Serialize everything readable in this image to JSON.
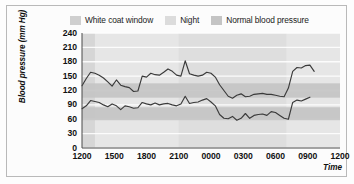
{
  "figure": {
    "border_color": "#b9b9b9",
    "background": "#fcfcfc"
  },
  "legend": {
    "position": "top-center",
    "items": [
      {
        "label": "White coat window",
        "color": "#cfcfcf",
        "name": "white-coat-window"
      },
      {
        "label": "Night",
        "color": "#d9d9d9",
        "name": "night"
      },
      {
        "label": "Normal blood pressure",
        "color": "#c2c2c2",
        "name": "normal-blood-pressure"
      }
    ]
  },
  "chart_data": {
    "type": "line",
    "title": "",
    "xlabel": "Time",
    "ylabel": "Blood pressure (mm Hg)",
    "ylim": [
      0,
      240
    ],
    "yticks": [
      0,
      30,
      60,
      90,
      120,
      150,
      180,
      210,
      240
    ],
    "ytick_labels": [
      "0",
      "30",
      "60",
      "90",
      "120",
      "150",
      "180",
      "210",
      "240"
    ],
    "xticks": [
      0,
      3,
      6,
      9,
      12,
      15,
      18,
      21,
      24
    ],
    "xtick_labels": [
      "1200",
      "1500",
      "1800",
      "2100",
      "0000",
      "0300",
      "0600",
      "0900",
      "1200"
    ],
    "xlim_hours": [
      0,
      24
    ],
    "grid": "horizontal-white-gridlines",
    "plot_background": "#e6e6e6",
    "line_color": "#3a3a3a",
    "bands": [
      {
        "name": "white-coat-window",
        "orientation": "vertical",
        "x_start_hours": 0.0,
        "x_end_hours": 1.2,
        "color": "#d2d2d2",
        "label": "White coat window"
      },
      {
        "name": "night",
        "orientation": "vertical",
        "x_start_hours": 9.0,
        "x_end_hours": 19.0,
        "color": "#dcdcdc",
        "label": "Night"
      },
      {
        "name": "normal-systolic",
        "orientation": "horizontal",
        "y_low": 105,
        "y_high": 135,
        "color": "#c4c4c4",
        "label": "Normal blood pressure"
      },
      {
        "name": "normal-diastolic",
        "orientation": "horizontal",
        "y_low": 58,
        "y_high": 85,
        "color": "#c4c4c4",
        "label": "Normal blood pressure"
      }
    ],
    "series": [
      {
        "name": "Systolic",
        "color": "#3a3a3a",
        "x": [
          0.0,
          0.4,
          0.8,
          1.2,
          1.6,
          2.0,
          2.4,
          2.8,
          3.2,
          3.6,
          4.0,
          4.4,
          4.8,
          5.2,
          5.6,
          6.0,
          6.4,
          6.8,
          7.2,
          7.6,
          8.0,
          8.4,
          8.8,
          9.2,
          9.6,
          10.0,
          10.4,
          10.8,
          11.2,
          11.6,
          12.0,
          12.4,
          12.8,
          13.2,
          13.6,
          14.0,
          14.4,
          14.8,
          15.2,
          15.6,
          16.0,
          16.4,
          16.8,
          17.2,
          17.6,
          18.0,
          18.4,
          18.8,
          19.2,
          19.6,
          20.0,
          20.4,
          20.8,
          21.2,
          21.6
        ],
        "values": [
          130,
          145,
          158,
          156,
          152,
          146,
          138,
          129,
          142,
          131,
          128,
          126,
          118,
          119,
          150,
          148,
          156,
          153,
          152,
          158,
          165,
          160,
          152,
          150,
          182,
          155,
          152,
          150,
          152,
          158,
          156,
          148,
          132,
          120,
          108,
          104,
          110,
          113,
          107,
          108,
          112,
          113,
          114,
          112,
          112,
          110,
          108,
          107,
          125,
          160,
          168,
          167,
          172,
          173,
          160
        ]
      },
      {
        "name": "Diastolic",
        "color": "#3a3a3a",
        "x": [
          0.0,
          0.4,
          0.8,
          1.2,
          1.6,
          2.0,
          2.4,
          2.8,
          3.2,
          3.6,
          4.0,
          4.4,
          4.8,
          5.2,
          5.6,
          6.0,
          6.4,
          6.8,
          7.2,
          7.6,
          8.0,
          8.4,
          8.8,
          9.2,
          9.6,
          10.0,
          10.4,
          10.8,
          11.2,
          11.6,
          12.0,
          12.4,
          12.8,
          13.2,
          13.6,
          14.0,
          14.4,
          14.8,
          15.2,
          15.6,
          16.0,
          16.4,
          16.8,
          17.2,
          17.6,
          18.0,
          18.4,
          18.8,
          19.2,
          19.6,
          20.0,
          20.4,
          20.8,
          21.2
        ],
        "values": [
          82,
          88,
          99,
          97,
          95,
          90,
          86,
          92,
          88,
          80,
          88,
          86,
          83,
          84,
          95,
          92,
          90,
          94,
          90,
          92,
          93,
          90,
          88,
          92,
          108,
          93,
          95,
          96,
          100,
          103,
          96,
          88,
          70,
          62,
          61,
          66,
          58,
          62,
          72,
          62,
          68,
          70,
          71,
          68,
          76,
          74,
          68,
          62,
          60,
          95,
          100,
          98,
          102,
          106
        ]
      }
    ]
  }
}
